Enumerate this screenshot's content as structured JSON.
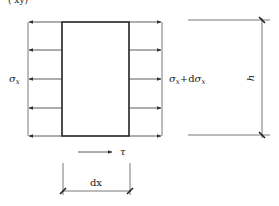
{
  "figure": {
    "top_fragment": "(    xy)",
    "labels": {
      "left_stress": "σ",
      "left_stress_sub": "x",
      "right_stress_main": "σ",
      "right_stress_sub": "x",
      "right_stress_plus": "+d",
      "right_stress_main2": "σ",
      "right_stress_sub2": "x",
      "shear": "τ",
      "width": "dx",
      "height": "h"
    },
    "colors": {
      "line": "#333333",
      "thin_line": "#555555",
      "text": "#222222",
      "background": "#ffffff"
    },
    "element": {
      "x": 62,
      "y": 22,
      "width": 67,
      "height": 114
    },
    "arrow_rows_y": [
      22,
      50,
      79,
      108,
      136
    ]
  }
}
